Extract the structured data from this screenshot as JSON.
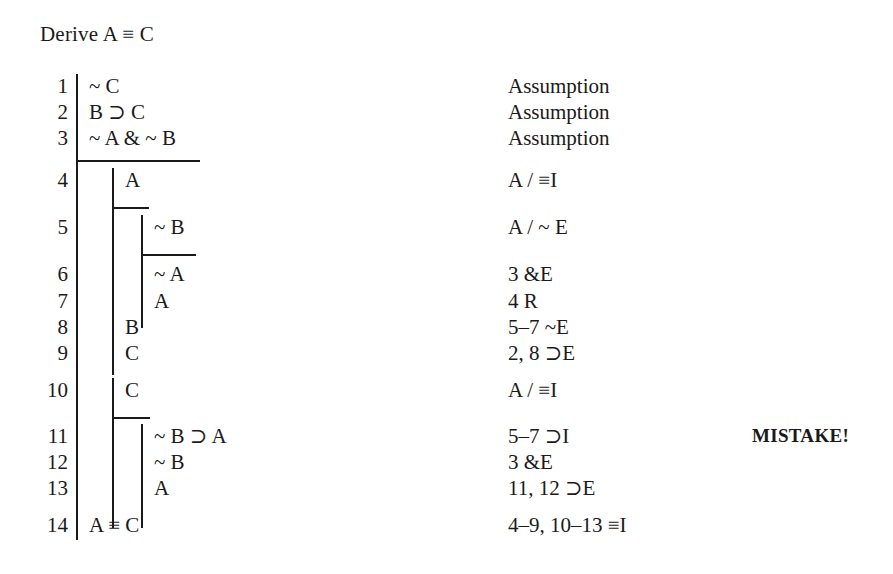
{
  "document": {
    "type": "natural-deduction-proof",
    "goal_label": "Derive A ≡ C",
    "annotation": {
      "text": "MISTAKE!",
      "at_line": 11
    },
    "columns": {
      "number_header": "",
      "formula_header": "",
      "justification_header": ""
    },
    "lines": [
      {
        "number": "1",
        "formula": "~ C",
        "justification": "Assumption",
        "depth": 1
      },
      {
        "number": "2",
        "formula": "B ⊃ C",
        "justification": "Assumption",
        "depth": 1
      },
      {
        "number": "3",
        "formula": "~ A & ~ B",
        "justification": "Assumption",
        "depth": 1
      },
      {
        "number": "4",
        "formula": "A",
        "justification": "A / ≡I",
        "depth": 2
      },
      {
        "number": "5",
        "formula": "~ B",
        "justification": "A / ~ E",
        "depth": 3
      },
      {
        "number": "6",
        "formula": "~ A",
        "justification": "3 &E",
        "depth": 3
      },
      {
        "number": "7",
        "formula": "A",
        "justification": "4 R",
        "depth": 3
      },
      {
        "number": "8",
        "formula": "B",
        "justification": "5–7 ~E",
        "depth": 2
      },
      {
        "number": "9",
        "formula": "C",
        "justification": "2, 8 ⊃E",
        "depth": 2
      },
      {
        "number": "10",
        "formula": "C",
        "justification": "A / ≡I",
        "depth": 2
      },
      {
        "number": "11",
        "formula": "~ B ⊃ A",
        "justification": "5–7 ⊃I",
        "depth": 3
      },
      {
        "number": "12",
        "formula": "~ B",
        "justification": "3 &E",
        "depth": 3
      },
      {
        "number": "13",
        "formula": "A",
        "justification": "11, 12 ⊃E",
        "depth": 3
      },
      {
        "number": "14",
        "formula": "A ≡ C",
        "justification": "4–9, 10–13 ≡I",
        "depth": 1
      }
    ]
  },
  "colors": {
    "background": "#ffffff",
    "ink": "#1a1a1a",
    "rule": "#1a1a1a"
  }
}
